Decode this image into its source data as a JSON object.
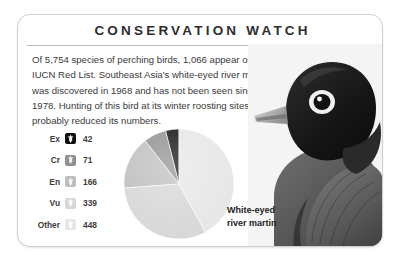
{
  "card": {
    "title": "CONSERVATION WATCH",
    "body": "Of 5,754 species of perching birds, 1,066 appear on the IUCN Red List. Southeast Asia's white-eyed river martin was discovered in 1968 and has not been seen since 1978. Hunting of this bird at its winter roosting sites has probably reduced its numbers."
  },
  "photo": {
    "caption_line1": "White-eyed",
    "caption_line2": "river martin",
    "subject": "white-eyed-river-martin",
    "icon": "bird-photo"
  },
  "legend": {
    "rows": [
      {
        "label": "Ex",
        "value": "42",
        "color": "#0f0f0f",
        "glyph": "bird-glyph"
      },
      {
        "label": "Cr",
        "value": "71",
        "color": "#8f8f8f",
        "glyph": "bird-glyph"
      },
      {
        "label": "En",
        "value": "166",
        "color": "#bdbdbd",
        "glyph": "bird-glyph"
      },
      {
        "label": "Vu",
        "value": "339",
        "color": "#d6d6d6",
        "glyph": "bird-glyph"
      },
      {
        "label": "Other",
        "value": "448",
        "color": "#e6e6e6",
        "glyph": "bird-glyph"
      }
    ]
  },
  "chart_data": {
    "type": "pie",
    "title": "",
    "categories": [
      "Ex",
      "Cr",
      "En",
      "Vu",
      "Other"
    ],
    "values": [
      42,
      71,
      166,
      339,
      448
    ],
    "total": 1066,
    "colors": [
      "#0f0f0f",
      "#8f8f8f",
      "#bdbdbd",
      "#d6d6d6",
      "#e6e6e6"
    ],
    "legend": "left",
    "start_angle_deg": 270,
    "direction": "counterclockwise",
    "units": "species on IUCN Red List",
    "annotations": [
      "Of 5,754 species of perching birds, 1,066 appear on the IUCN Red List."
    ]
  }
}
